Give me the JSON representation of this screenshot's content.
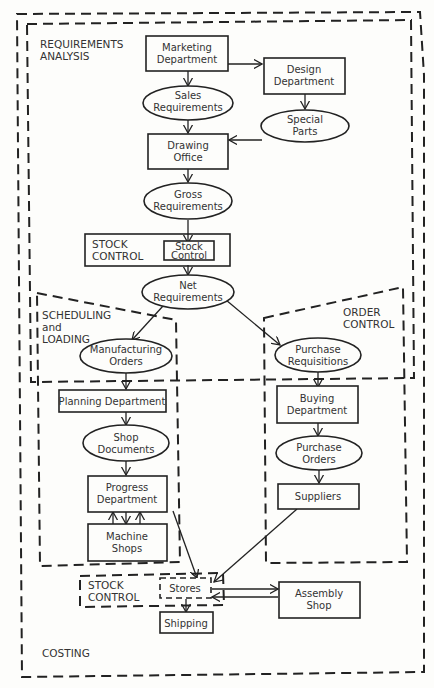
{
  "regions": {
    "requirements_analysis": {
      "line1": "REQUIREMENTS",
      "line2": "ANALYSIS"
    },
    "scheduling_loading": {
      "line1": "SCHEDULING",
      "line2": "and",
      "line3": "LOADING"
    },
    "order_control": {
      "line1": "ORDER",
      "line2": "CONTROL"
    },
    "stock_control_top": {
      "line1": "STOCK",
      "line2": "CONTROL"
    },
    "stock_control_bottom": {
      "line1": "STOCK",
      "line2": "CONTROL"
    },
    "costing": {
      "label": "COSTING"
    }
  },
  "nodes": {
    "marketing": {
      "line1": "Marketing",
      "line2": "Department",
      "shape": "rect"
    },
    "design": {
      "line1": "Design",
      "line2": "Department",
      "shape": "rect"
    },
    "sales_req": {
      "line1": "Sales",
      "line2": "Requirements",
      "shape": "ellipse"
    },
    "special_parts": {
      "line1": "Special",
      "line2": "Parts",
      "shape": "ellipse"
    },
    "drawing_office": {
      "line1": "Drawing",
      "line2": "Office",
      "shape": "rect"
    },
    "gross_req": {
      "line1": "Gross",
      "line2": "Requirements",
      "shape": "ellipse"
    },
    "stock_control": {
      "line1": "Stock",
      "line2": "Control",
      "shape": "rect"
    },
    "net_req": {
      "line1": "Net",
      "line2": "Requirements",
      "shape": "ellipse"
    },
    "mfg_orders": {
      "line1": "Manufacturing",
      "line2": "Orders",
      "shape": "ellipse"
    },
    "purchase_req": {
      "line1": "Purchase",
      "line2": "Requisitions",
      "shape": "ellipse"
    },
    "planning": {
      "line1": "Planning Department",
      "shape": "rect"
    },
    "buying": {
      "line1": "Buying",
      "line2": "Department",
      "shape": "rect"
    },
    "shop_docs": {
      "line1": "Shop",
      "line2": "Documents",
      "shape": "ellipse"
    },
    "purchase_orders": {
      "line1": "Purchase",
      "line2": "Orders",
      "shape": "ellipse"
    },
    "progress": {
      "line1": "Progress",
      "line2": "Department",
      "shape": "rect"
    },
    "suppliers": {
      "line1": "Suppliers",
      "shape": "rect"
    },
    "machine_shops": {
      "line1": "Machine",
      "line2": "Shops",
      "shape": "rect"
    },
    "stores": {
      "line1": "Stores",
      "shape": "dashed-rect"
    },
    "assembly": {
      "line1": "Assembly",
      "line2": "Shop",
      "shape": "rect"
    },
    "shipping": {
      "line1": "Shipping",
      "shape": "rect"
    }
  },
  "edges": [
    [
      "marketing",
      "sales_req"
    ],
    [
      "marketing",
      "design"
    ],
    [
      "design",
      "special_parts"
    ],
    [
      "sales_req",
      "drawing_office"
    ],
    [
      "special_parts",
      "drawing_office"
    ],
    [
      "drawing_office",
      "gross_req"
    ],
    [
      "gross_req",
      "stock_control"
    ],
    [
      "stock_control",
      "net_req"
    ],
    [
      "net_req",
      "mfg_orders"
    ],
    [
      "net_req",
      "purchase_req"
    ],
    [
      "mfg_orders",
      "planning"
    ],
    [
      "purchase_req",
      "buying"
    ],
    [
      "planning",
      "shop_docs"
    ],
    [
      "buying",
      "purchase_orders"
    ],
    [
      "shop_docs",
      "progress"
    ],
    [
      "purchase_orders",
      "suppliers"
    ],
    [
      "progress",
      "machine_shops"
    ],
    [
      "machine_shops",
      "progress"
    ],
    [
      "progress",
      "stores"
    ],
    [
      "suppliers",
      "stores"
    ],
    [
      "stores",
      "assembly"
    ],
    [
      "assembly",
      "stores"
    ],
    [
      "stores",
      "shipping"
    ]
  ],
  "colors": {
    "ink": "#222222",
    "text": "#333333",
    "paper": "#fdfdfb"
  }
}
